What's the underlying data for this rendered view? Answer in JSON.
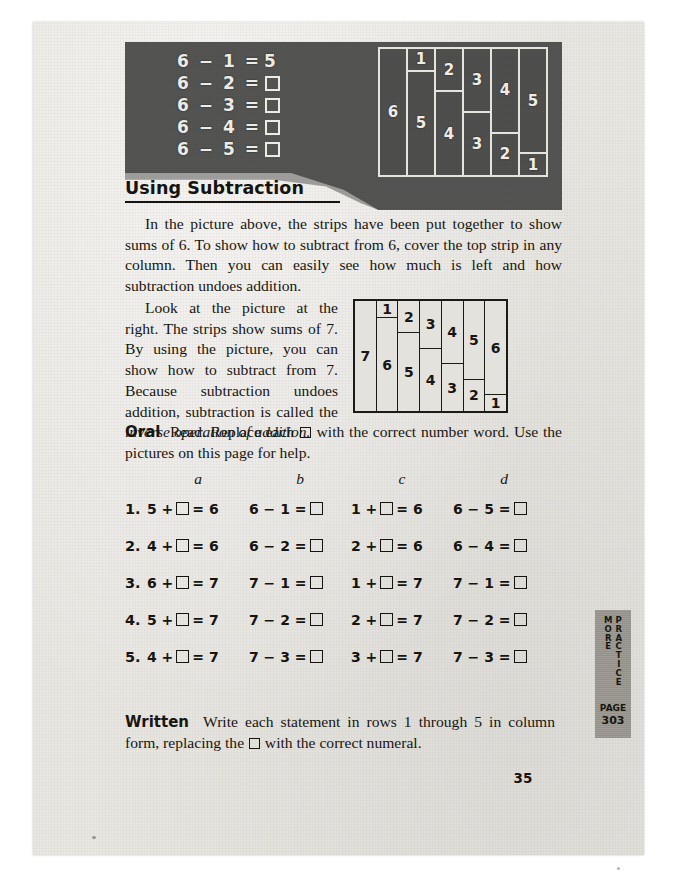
{
  "page": {
    "folio": "35",
    "section_heading": "Using Subtraction"
  },
  "photo_panel": {
    "chalk_equations": [
      {
        "left": "6 − 1 =",
        "answer": "5",
        "has_box": false
      },
      {
        "left": "6 − 2 =",
        "answer": "",
        "has_box": true
      },
      {
        "left": "6 − 3 =",
        "answer": "",
        "has_box": true
      },
      {
        "left": "6 − 4 =",
        "answer": "",
        "has_box": true
      },
      {
        "left": "6 − 5 =",
        "answer": "",
        "has_box": true
      }
    ],
    "strip_picture_6": {
      "caption_sum": "6",
      "columns": [
        {
          "cells": [
            {
              "label": "6",
              "flex": 100
            }
          ]
        },
        {
          "cells": [
            {
              "label": "1",
              "flex": 16.7
            },
            {
              "label": "5",
              "flex": 83.3
            }
          ]
        },
        {
          "cells": [
            {
              "label": "2",
              "flex": 33.3
            },
            {
              "label": "4",
              "flex": 66.7
            }
          ]
        },
        {
          "cells": [
            {
              "label": "3",
              "flex": 50
            },
            {
              "label": "3",
              "flex": 50
            }
          ]
        },
        {
          "cells": [
            {
              "label": "4",
              "flex": 66.7
            },
            {
              "label": "2",
              "flex": 33.3
            }
          ]
        },
        {
          "cells": [
            {
              "label": "5",
              "flex": 83.3
            },
            {
              "label": "1",
              "flex": 16.7
            }
          ]
        }
      ]
    }
  },
  "body": {
    "paragraph_1": "In the picture above, the strips have been put together to show sums of 6.  To show how to subtract from 6, cover the top strip in any column.  Then you can easily see how much is left and how subtraction undoes addition.",
    "paragraph_2_part1": "Look at the picture at the right.  The strips show sums of 7.  By using the picture, you can show how to subtract from 7. Because subtraction undoes addition, subtraction is called the ",
    "paragraph_2_italic": "inverse operation of addition.",
    "oral_label": "Oral",
    "oral_text_before_box": "Read.  Replace each ",
    "oral_text_after_box": " with the correct number word.  Use the pictures on this page for help.",
    "written_label": "Written",
    "written_text_before_box": "Write each statement in rows 1 through 5 in column form, replacing the ",
    "written_text_after_box": " with the correct numeral."
  },
  "strip_picture_7": {
    "caption_sum": "7",
    "columns": [
      {
        "cells": [
          {
            "label": "7",
            "flex": 100
          }
        ]
      },
      {
        "cells": [
          {
            "label": "1",
            "flex": 14.3
          },
          {
            "label": "6",
            "flex": 85.7
          }
        ]
      },
      {
        "cells": [
          {
            "label": "2",
            "flex": 28.6
          },
          {
            "label": "5",
            "flex": 71.4
          }
        ]
      },
      {
        "cells": [
          {
            "label": "3",
            "flex": 42.9
          },
          {
            "label": "4",
            "flex": 57.1
          }
        ]
      },
      {
        "cells": [
          {
            "label": "4",
            "flex": 57.1
          },
          {
            "label": "3",
            "flex": 42.9
          }
        ]
      },
      {
        "cells": [
          {
            "label": "5",
            "flex": 71.4
          },
          {
            "label": "2",
            "flex": 28.6
          }
        ]
      },
      {
        "cells": [
          {
            "label": "6",
            "flex": 85.7
          },
          {
            "label": "1",
            "flex": 14.3
          }
        ]
      }
    ]
  },
  "exercises": {
    "column_headers": [
      "a",
      "b",
      "c",
      "d"
    ],
    "rows": [
      {
        "number": "1.",
        "cells": [
          {
            "pre": "5 +",
            "post": "= 6"
          },
          {
            "pre": "6 − 1 =",
            "post": ""
          },
          {
            "pre": "1 +",
            "post": "= 6"
          },
          {
            "pre": "6 − 5 =",
            "post": ""
          }
        ]
      },
      {
        "number": "2.",
        "cells": [
          {
            "pre": "4 +",
            "post": "= 6"
          },
          {
            "pre": "6 − 2 =",
            "post": ""
          },
          {
            "pre": "2 +",
            "post": "= 6"
          },
          {
            "pre": "6 − 4 =",
            "post": ""
          }
        ]
      },
      {
        "number": "3.",
        "cells": [
          {
            "pre": "6 +",
            "post": "= 7"
          },
          {
            "pre": "7 − 1 =",
            "post": ""
          },
          {
            "pre": "1 +",
            "post": "= 7"
          },
          {
            "pre": "7 − 1 =",
            "post": ""
          }
        ]
      },
      {
        "number": "4.",
        "cells": [
          {
            "pre": "5 +",
            "post": "= 7"
          },
          {
            "pre": "7 − 2 =",
            "post": ""
          },
          {
            "pre": "2 +",
            "post": "= 7"
          },
          {
            "pre": "7 − 2 =",
            "post": ""
          }
        ]
      },
      {
        "number": "5.",
        "cells": [
          {
            "pre": "4 +",
            "post": "= 7"
          },
          {
            "pre": "7 − 3 =",
            "post": ""
          },
          {
            "pre": "3 +",
            "post": "= 7"
          },
          {
            "pre": "7 − 3 =",
            "post": ""
          }
        ]
      }
    ]
  },
  "side_tab": {
    "word_1": "MORE",
    "word_2": "PRACTICE",
    "page_label": "PAGE",
    "page_number": "303"
  }
}
